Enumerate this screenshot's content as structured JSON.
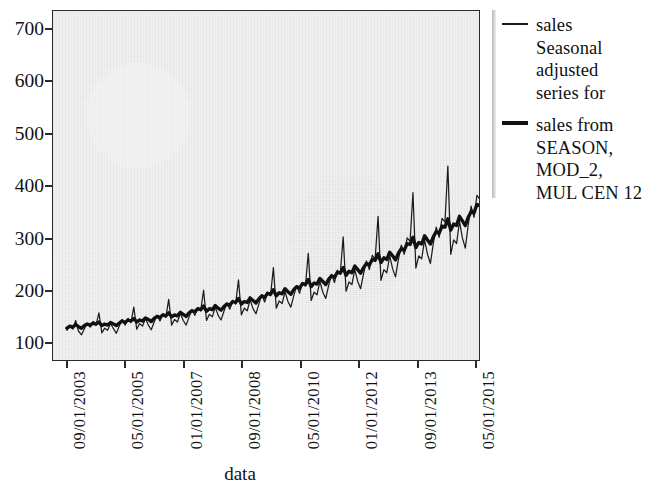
{
  "chart_data": {
    "type": "line",
    "title": "",
    "xlabel": "data",
    "ylabel": "",
    "ylim": [
      60,
      740
    ],
    "yticks": [
      100,
      200,
      300,
      400,
      500,
      600,
      700
    ],
    "grid": false,
    "legend_position": "right",
    "x_tick_labels": [
      "09/01/2003",
      "05/01/2005",
      "01/01/2007",
      "09/01/2008",
      "05/01/2010",
      "01/01/2012",
      "09/01/2013",
      "05/01/2015"
    ],
    "x_tick_indices": [
      0,
      20,
      40,
      60,
      80,
      100,
      120,
      140
    ],
    "x_start": "09/01/2003",
    "x_end": "08/01/2015",
    "n_points": 144,
    "series": [
      {
        "name": "sales Seasonal adjusted series for",
        "style": "thin",
        "color": "#1c1c1c",
        "width": 1.25,
        "values": [
          118,
          127,
          120,
          137,
          116,
          109,
          121,
          132,
          124,
          135,
          128,
          152,
          113,
          122,
          118,
          131,
          121,
          112,
          126,
          139,
          128,
          141,
          133,
          163,
          120,
          131,
          126,
          141,
          128,
          119,
          134,
          147,
          136,
          150,
          143,
          178,
          128,
          139,
          134,
          151,
          137,
          128,
          144,
          158,
          147,
          162,
          156,
          196,
          137,
          149,
          144,
          163,
          147,
          138,
          155,
          171,
          159,
          176,
          169,
          216,
          148,
          161,
          156,
          177,
          160,
          150,
          169,
          187,
          173,
          192,
          185,
          240,
          161,
          175,
          170,
          193,
          174,
          163,
          185,
          205,
          190,
          211,
          204,
          268,
          176,
          192,
          187,
          213,
          192,
          180,
          205,
          227,
          211,
          235,
          228,
          300,
          194,
          212,
          207,
          236,
          213,
          199,
          228,
          253,
          236,
          264,
          257,
          340,
          215,
          236,
          230,
          263,
          238,
          222,
          256,
          284,
          266,
          298,
          291,
          386,
          239,
          263,
          257,
          294,
          266,
          248,
          287,
          319,
          299,
          336,
          329,
          438,
          266,
          294,
          287,
          330,
          298,
          278,
          323,
          360,
          338,
          381,
          373,
          500,
          296,
          328,
          321,
          370,
          334,
          312,
          363,
          406,
          382,
          432,
          424,
          570,
          330,
          366,
          358,
          414,
          374,
          350,
          408,
          457,
          431,
          489,
          481,
          615,
          368,
          409,
          401,
          464,
          419,
          393
        ]
      },
      {
        "name": "sales from SEASON, MOD_2, MUL CEN 12",
        "style": "thick",
        "color": "#111111",
        "width": 3.4,
        "values": [
          122,
          126,
          124,
          129,
          125,
          122,
          127,
          130,
          128,
          132,
          130,
          134,
          127,
          130,
          128,
          133,
          130,
          127,
          132,
          136,
          133,
          138,
          136,
          141,
          134,
          138,
          136,
          142,
          139,
          135,
          141,
          145,
          143,
          148,
          146,
          152,
          144,
          148,
          146,
          153,
          149,
          145,
          152,
          156,
          154,
          160,
          158,
          165,
          155,
          160,
          158,
          166,
          161,
          157,
          164,
          169,
          167,
          174,
          172,
          180,
          169,
          174,
          172,
          181,
          176,
          171,
          179,
          185,
          182,
          190,
          188,
          197,
          185,
          191,
          189,
          199,
          193,
          188,
          197,
          203,
          200,
          209,
          207,
          217,
          203,
          210,
          208,
          219,
          213,
          207,
          217,
          224,
          221,
          231,
          229,
          240,
          225,
          233,
          230,
          243,
          236,
          229,
          240,
          248,
          245,
          256,
          254,
          267,
          250,
          259,
          256,
          270,
          263,
          255,
          268,
          277,
          274,
          287,
          285,
          299,
          279,
          289,
          286,
          302,
          294,
          286,
          300,
          310,
          307,
          321,
          319,
          335,
          313,
          325,
          322,
          340,
          331,
          322,
          338,
          349,
          347,
          363,
          361,
          379,
          353,
          367,
          364,
          384,
          374,
          364,
          382,
          395,
          393,
          412,
          409,
          430,
          400,
          416,
          413,
          437,
          425,
          414,
          435,
          450,
          448,
          470,
          467,
          492,
          456,
          474,
          471,
          499,
          486,
          473
        ]
      }
    ],
    "annotations": []
  },
  "axes": {
    "y_labels": [
      "700",
      "600",
      "500",
      "400",
      "300",
      "200",
      "100"
    ],
    "y_positions": [
      28,
      80,
      133,
      185,
      238,
      290,
      342
    ],
    "x_labels": [
      "09/01/2003",
      "05/01/2005",
      "01/01/2007",
      "09/01/2008",
      "05/01/2010",
      "01/01/2012",
      "09/01/2013",
      "05/01/2015"
    ],
    "x_positions": [
      66,
      124,
      183,
      241,
      300,
      358,
      417,
      475
    ],
    "x_axis_title": "data"
  },
  "legend": {
    "entries": [
      {
        "swatch": "thin",
        "label": "sales\nSeasonal\nadjusted\nseries for"
      },
      {
        "swatch": "thick",
        "label": "sales from\nSEASON,\nMOD_2,\nMUL CEN 12"
      }
    ]
  },
  "colors": {
    "plot_background": "#e9e9e9",
    "page_background": "#ffffff",
    "axis": "#2b2b2b",
    "thin_series": "#1c1c1c",
    "thick_series": "#111111"
  }
}
